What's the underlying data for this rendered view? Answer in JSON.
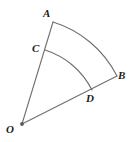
{
  "figure": {
    "type": "geometry-diagram",
    "background_color": "#ffffff",
    "stroke_color": "#6e6e6e",
    "label_color": "#1c1c1c",
    "stroke_width": 1,
    "canvas": {
      "width": 130,
      "height": 142
    },
    "points": {
      "O": {
        "label": "O",
        "x": 22,
        "y": 124,
        "role": "center-vertex",
        "has_dot": true
      },
      "A": {
        "label": "A",
        "x": 53,
        "y": 22,
        "role": "outer-arc-endpoint",
        "has_dot": false
      },
      "B": {
        "label": "B",
        "x": 117,
        "y": 76,
        "role": "outer-arc-endpoint",
        "has_dot": false
      },
      "C": {
        "label": "C",
        "x": 45,
        "y": 50,
        "role": "inner-arc-endpoint",
        "has_dot": false
      },
      "D": {
        "label": "D",
        "x": 92,
        "y": 90,
        "role": "inner-arc-endpoint",
        "has_dot": false
      }
    },
    "segments": [
      {
        "name": "segment-OA",
        "from": "O",
        "to": "A"
      },
      {
        "name": "segment-OB",
        "from": "O",
        "to": "B"
      }
    ],
    "arcs": [
      {
        "name": "outer-arc-AB",
        "from": "A",
        "to": "B",
        "radius": 107,
        "sweep": "clockwise"
      },
      {
        "name": "inner-arc-CD",
        "from": "C",
        "to": "D",
        "radius": 79,
        "sweep": "clockwise"
      }
    ]
  }
}
